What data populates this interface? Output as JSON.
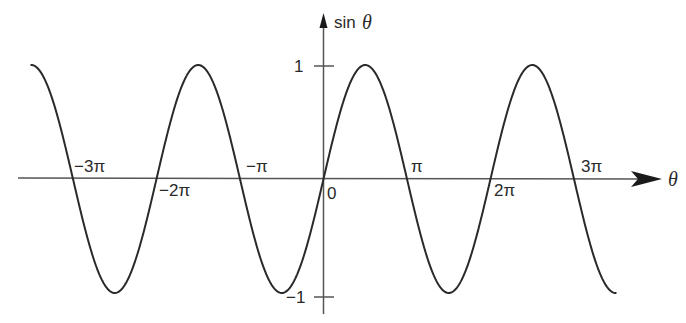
{
  "chart_data": {
    "type": "line",
    "title": "",
    "xlabel": "θ",
    "ylabel": "sin θ",
    "function": "sin(theta)",
    "x_range": [
      "-3.5π",
      "3.5π"
    ],
    "ylim": [
      -1,
      1
    ],
    "grid": false,
    "legend": null,
    "x_tick_labels": [
      "-3π",
      "-2π",
      "-π",
      "0",
      "π",
      "2π",
      "3π"
    ],
    "x_tick_values": [
      -9.4248,
      -6.2832,
      -3.1416,
      0,
      3.1416,
      6.2832,
      9.4248
    ],
    "y_tick_labels": [
      "1",
      "-1"
    ],
    "y_tick_values": [
      1,
      -1
    ],
    "series": [
      {
        "name": "sin θ",
        "x": [
          -10.9956,
          -9.4248,
          -7.854,
          -6.2832,
          -4.7124,
          -3.1416,
          -1.5708,
          0,
          1.5708,
          3.1416,
          4.7124,
          6.2832,
          7.854,
          9.4248,
          10.9956
        ],
        "values": [
          1,
          0,
          -1,
          0,
          1,
          0,
          -1,
          0,
          1,
          0,
          -1,
          0,
          1,
          0,
          -1
        ]
      }
    ],
    "color": "#2a2a2a"
  },
  "labels": {
    "y_axis": "sin θ",
    "x_axis": "θ",
    "y_pos_one": "1",
    "y_neg_one": "−1",
    "zero": "0",
    "neg_3pi": "−3π",
    "neg_2pi": "−2π",
    "neg_pi": "−π",
    "pi": "π",
    "two_pi": "2π",
    "three_pi": "3π"
  }
}
